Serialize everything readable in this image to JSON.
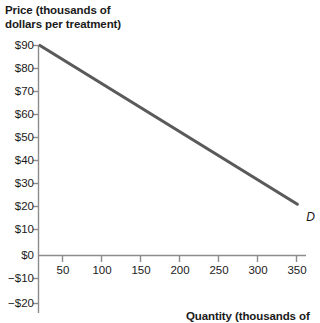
{
  "chart_data": {
    "type": "line",
    "title": "",
    "ylabel": "Price (thousands of dollars per treatment)",
    "xlabel": "Quantity (thousands of",
    "grid": false,
    "legend": "none",
    "xlim": [
      0,
      360
    ],
    "ylim": [
      -20,
      90
    ],
    "x_ticks": [
      50,
      100,
      150,
      200,
      250,
      300,
      350
    ],
    "x_tick_labels": [
      "50",
      "100",
      "150",
      "200",
      "250",
      "300",
      "350"
    ],
    "y_ticks": [
      90,
      80,
      70,
      60,
      50,
      40,
      30,
      20,
      10,
      0,
      -10,
      -20
    ],
    "y_tick_labels": [
      "$90",
      "$80",
      "$70",
      "$60",
      "$50",
      "$40",
      "$30",
      "$20",
      "$10",
      "$0",
      "−$10",
      "−$20"
    ],
    "series": [
      {
        "name": "D",
        "label": "D",
        "color": "#5a5a5a",
        "points": [
          {
            "x": 0,
            "y": 90
          },
          {
            "x": 330,
            "y": 22
          }
        ]
      }
    ],
    "annotations": [
      {
        "text": "D",
        "x": 340,
        "y": 17
      }
    ]
  },
  "axes": {
    "y_title_line1": "Price (thousands of",
    "y_title_line2": "dollars per treatment)",
    "x_title": "Quantity (thousands of"
  },
  "colors": {
    "curve": "#5a5a5a",
    "axis": "#8c8c8c",
    "text": "#1a1a1a",
    "background": "#ffffff"
  }
}
